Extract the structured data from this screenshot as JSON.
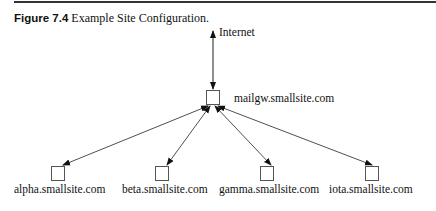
{
  "figure": {
    "number": "Figure 7.4",
    "caption": " Example Site Configuration."
  },
  "diagram": {
    "internet_label": "Internet",
    "gateway": {
      "label": "mailgw.smallsite.com"
    },
    "hosts": [
      {
        "label": "alpha.smallsite.com"
      },
      {
        "label": "beta.smallsite.com"
      },
      {
        "label": "gamma.smallsite.com"
      },
      {
        "label": "iota.smallsite.com"
      }
    ],
    "colors": {
      "line": "#222222",
      "box": "#555555"
    }
  }
}
